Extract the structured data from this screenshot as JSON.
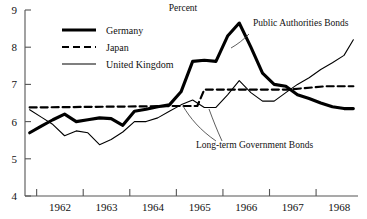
{
  "chart_data": {
    "type": "line",
    "title": "Percent",
    "xlabel": "",
    "ylabel": "",
    "xlim": [
      1961.75,
      1968.9
    ],
    "ylim": [
      4,
      9
    ],
    "yticks": [
      4,
      5,
      6,
      7,
      8,
      9
    ],
    "ytick_labels": [
      "4",
      "5",
      "6",
      "7",
      "8",
      "9"
    ],
    "xtick_labels": [
      "1962",
      "1963",
      "1964",
      "1965",
      "1966",
      "1967",
      "1968"
    ],
    "xtick_values": [
      1962,
      1963,
      1964,
      1965,
      1966,
      1967,
      1968
    ],
    "grid": false,
    "legend_position": "upper-left",
    "series": [
      {
        "name": "Germany",
        "style": "thick-solid",
        "color": "#000000",
        "x": [
          1961.85,
          1962.1,
          1962.35,
          1962.6,
          1962.85,
          1963.1,
          1963.35,
          1963.6,
          1963.85,
          1964.1,
          1964.35,
          1964.6,
          1964.85,
          1965.1,
          1965.35,
          1965.6,
          1965.85,
          1966.1,
          1966.35,
          1966.6,
          1966.85,
          1967.1,
          1967.35,
          1967.6,
          1967.85,
          1968.1,
          1968.35,
          1968.6,
          1968.8
        ],
        "values": [
          5.7,
          5.88,
          6.05,
          6.2,
          6.0,
          6.05,
          6.1,
          6.08,
          5.9,
          6.28,
          6.33,
          6.4,
          6.45,
          6.8,
          7.62,
          7.65,
          7.62,
          8.3,
          8.65,
          8.0,
          7.3,
          7.0,
          6.95,
          6.72,
          6.62,
          6.5,
          6.4,
          6.35,
          6.35
        ]
      },
      {
        "name": "Japan",
        "style": "dashed",
        "color": "#000000",
        "x": [
          1961.85,
          1963.5,
          1965.0,
          1965.45,
          1965.6,
          1967.4,
          1968.2,
          1968.8
        ],
        "values": [
          6.38,
          6.4,
          6.42,
          6.42,
          6.86,
          6.86,
          6.95,
          6.95
        ]
      },
      {
        "name": "United Kingdom",
        "style": "thin-solid",
        "color": "#000000",
        "x": [
          1961.85,
          1962.1,
          1962.35,
          1962.6,
          1962.85,
          1963.1,
          1963.35,
          1963.6,
          1963.85,
          1964.1,
          1964.35,
          1964.6,
          1964.85,
          1965.1,
          1965.35,
          1965.6,
          1965.85,
          1966.1,
          1966.35,
          1966.6,
          1966.85,
          1967.1,
          1967.35,
          1967.6,
          1967.85,
          1968.1,
          1968.35,
          1968.6,
          1968.8
        ],
        "values": [
          6.32,
          6.12,
          5.92,
          5.62,
          5.75,
          5.7,
          5.38,
          5.52,
          5.72,
          6.0,
          6.0,
          6.1,
          6.28,
          6.45,
          6.58,
          6.38,
          6.38,
          6.72,
          7.1,
          6.78,
          6.55,
          6.55,
          6.78,
          7.0,
          7.18,
          7.4,
          7.58,
          7.78,
          8.2
        ]
      }
    ],
    "annotations": [
      {
        "text": "Public Authorities Bonds",
        "x": 253,
        "y": 26
      },
      {
        "text": "Long-term Government Bonds",
        "x": 196,
        "y": 148
      }
    ]
  }
}
